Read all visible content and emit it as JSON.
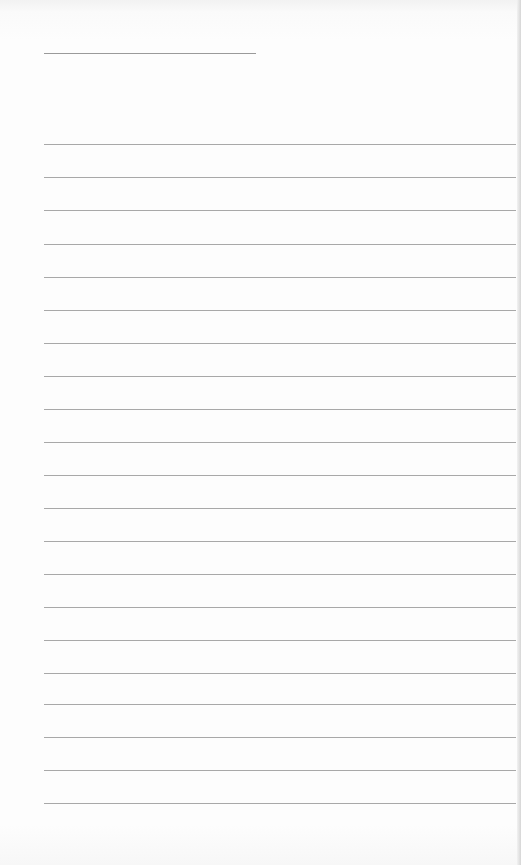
{
  "page": {
    "type": "lined-paper",
    "background_color": "#fdfdfd",
    "line_color": "#a8a8a8",
    "title_line": {
      "x": 44,
      "y": 53,
      "width": 212
    },
    "rules": {
      "count": 21,
      "x": 44,
      "width": 472,
      "positions_y": [
        144,
        177,
        210,
        244,
        277,
        310,
        343,
        376,
        409,
        442,
        475,
        508,
        541,
        574,
        607,
        640,
        673,
        704,
        737,
        770,
        803
      ]
    }
  }
}
